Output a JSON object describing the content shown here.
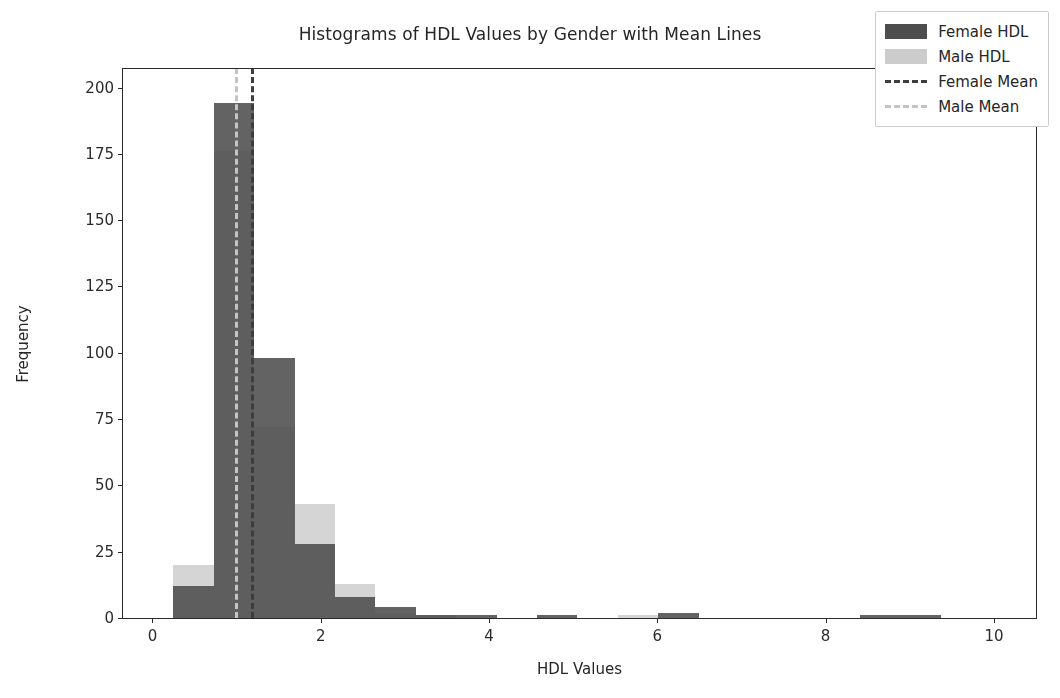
{
  "chart_data": {
    "type": "bar",
    "title": "Histograms of HDL Values by Gender with Mean Lines",
    "xlabel": "HDL Values",
    "ylabel": "Frequency",
    "xlim": [
      -0.35,
      10.5
    ],
    "ylim": [
      0,
      207
    ],
    "xticks": [
      0,
      2,
      4,
      6,
      8,
      10
    ],
    "yticks": [
      0,
      25,
      50,
      75,
      100,
      125,
      150,
      175,
      200
    ],
    "grid": false,
    "legend_position": "upper right",
    "bin_width": 0.48,
    "bin_edges": [
      0.25,
      0.73,
      1.21,
      1.69,
      2.17,
      2.65,
      3.13,
      3.61,
      4.09,
      4.57,
      5.05,
      5.53,
      6.01,
      6.49,
      6.97,
      7.45,
      7.93,
      8.41,
      8.89,
      9.37,
      9.85
    ],
    "series": [
      {
        "name": "Female HDL",
        "color": "#4d4d4d",
        "values": [
          12,
          194,
          98,
          28,
          8,
          4,
          1,
          1,
          0,
          1,
          0,
          0,
          2,
          0,
          0,
          0,
          0,
          1,
          1,
          0
        ]
      },
      {
        "name": "Male HDL",
        "color": "#cccccc",
        "values": [
          20,
          176,
          72,
          43,
          13,
          2,
          1,
          0,
          0,
          0,
          0,
          1,
          0,
          0,
          0,
          0,
          0,
          0,
          0,
          0
        ]
      }
    ],
    "mean_lines": [
      {
        "name": "Female Mean",
        "value": 1.17,
        "color": "#3d3d3d",
        "style": "dashed"
      },
      {
        "name": "Male Mean",
        "value": 0.98,
        "color": "#c4c4c4",
        "style": "dashed"
      }
    ]
  },
  "legend": {
    "items": [
      {
        "label": "Female HDL",
        "kind": "patch",
        "variant": "female"
      },
      {
        "label": "Male HDL",
        "kind": "patch",
        "variant": "male"
      },
      {
        "label": "Female Mean",
        "kind": "dash",
        "variant": "female-mean"
      },
      {
        "label": "Male Mean",
        "kind": "dash",
        "variant": "male-mean"
      }
    ]
  }
}
